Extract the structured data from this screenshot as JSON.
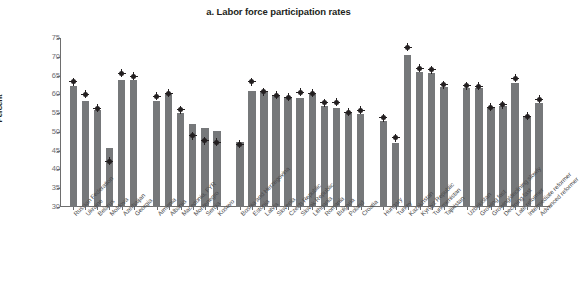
{
  "chart_data": {
    "type": "bar",
    "title": "a. Labor force participation rates",
    "xlabel": "",
    "ylabel": "Percent",
    "ylim": [
      30,
      75
    ],
    "ytick_values": [
      30,
      35,
      40,
      45,
      50,
      55,
      60,
      65,
      70,
      75
    ],
    "ytick_labels": [
      "30",
      "35",
      "40",
      "45",
      "50",
      "55",
      "60",
      "65",
      "70",
      "75"
    ],
    "grid": false,
    "legend": "none",
    "categories": [
      "Russian Federation",
      "Ukraine",
      "Belarus",
      "Moldova",
      "Azerbaijan",
      "Georgia",
      "Armenia",
      "Albania",
      "Macedonia, FYR",
      "Montenegro",
      "Serbia",
      "Kosovo",
      "Bosnia and Herzegovina",
      "Estonia",
      "Latvia",
      "Slovenia",
      "Czech Republic",
      "Slovak Republic",
      "Lithuania",
      "Romania",
      "Bulgaria",
      "Poland",
      "Croatia",
      "Hungary",
      "Turkey",
      "Kazakhstan",
      "Kyrgyz Republic",
      "Turkmenistan",
      "Tajikistan",
      "Uzbekistan",
      "Growing fast",
      "Growing/declining slowly",
      "Declining fast",
      "Late reformer",
      "Intermediate reformer",
      "Advanced reformer"
    ],
    "series": [
      {
        "name": "bar",
        "type": "bar",
        "values": [
          62.2,
          58.3,
          55.9,
          45.7,
          63.7,
          63.7,
          58.3,
          60.2,
          55.0,
          52.0,
          51.1,
          50.2,
          47.2,
          60.9,
          60.7,
          59.9,
          59.1,
          59.0,
          60.1,
          56.8,
          56.3,
          54.9,
          54.7,
          53.0,
          47.0,
          70.5,
          66.0,
          65.7,
          62.0,
          61.8,
          61.6,
          56.7,
          56.9,
          63.0,
          54.0,
          57.8
        ]
      },
      {
        "name": "marker",
        "type": "scatter",
        "values": [
          63.3,
          60.0,
          56.3,
          42.2,
          65.6,
          64.8,
          59.5,
          60.3,
          55.9,
          49.0,
          47.7,
          47.3,
          46.7,
          63.3,
          60.7,
          59.7,
          59.2,
          60.5,
          60.3,
          57.8,
          57.9,
          55.2,
          55.8,
          53.7,
          48.5,
          72.5,
          67.0,
          66.5,
          62.5,
          62.3,
          62.2,
          56.6,
          57.2,
          64.3,
          54.2,
          58.7
        ]
      }
    ],
    "group_separators_after": [
      6,
      12,
      23,
      29
    ],
    "colors": {
      "bar": "#76787a",
      "marker": "#231f20",
      "axis": "#6e6e6e",
      "text": "#231f20",
      "tick_text": "#6d6e71",
      "background": "#ffffff"
    }
  }
}
